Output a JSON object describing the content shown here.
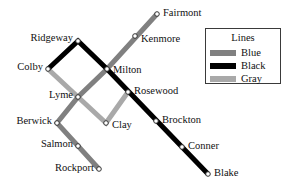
{
  "colors": {
    "blue_line": "#808080",
    "black_line": "#000000",
    "gray_line": "#a9a9a9",
    "station_fill": "#ffffff",
    "station_stroke": "#333333",
    "label_text": "#111111",
    "legend_border": "#3a3a3a",
    "background": "#ffffff"
  },
  "legend": {
    "title": "Lines",
    "entries": [
      {
        "name": "Blue",
        "color": "#808080"
      },
      {
        "name": "Black",
        "color": "#000000"
      },
      {
        "name": "Gray",
        "color": "#a9a9a9"
      }
    ]
  },
  "stations": [
    {
      "id": "fairmont",
      "label": "Fairmont",
      "x": 157,
      "y": 14,
      "label_x": 163,
      "label_y": 14,
      "anchor": "start"
    },
    {
      "id": "kenmore",
      "label": "Kenmore",
      "x": 135,
      "y": 36,
      "label_x": 141,
      "label_y": 40,
      "anchor": "start"
    },
    {
      "id": "ridgeway",
      "label": "Ridgeway",
      "x": 78,
      "y": 41,
      "label_x": 73,
      "label_y": 39,
      "anchor": "end"
    },
    {
      "id": "colby",
      "label": "Colby",
      "x": 48,
      "y": 69,
      "label_x": 43,
      "label_y": 68,
      "anchor": "end"
    },
    {
      "id": "milton",
      "label": "Milton",
      "x": 107,
      "y": 69,
      "label_x": 113,
      "label_y": 71,
      "anchor": "start"
    },
    {
      "id": "rosewood",
      "label": "Rosewood",
      "x": 128,
      "y": 92,
      "label_x": 134,
      "label_y": 92,
      "anchor": "start"
    },
    {
      "id": "lyme",
      "label": "Lyme",
      "x": 78,
      "y": 97,
      "label_x": 73,
      "label_y": 96,
      "anchor": "end"
    },
    {
      "id": "clay",
      "label": "Clay",
      "x": 106,
      "y": 123,
      "label_x": 112,
      "label_y": 126,
      "anchor": "start"
    },
    {
      "id": "brockton",
      "label": "Brockton",
      "x": 156,
      "y": 121,
      "label_x": 162,
      "label_y": 121,
      "anchor": "start"
    },
    {
      "id": "berwick",
      "label": "Berwick",
      "x": 57,
      "y": 123,
      "label_x": 52,
      "label_y": 122,
      "anchor": "end"
    },
    {
      "id": "conner",
      "label": "Conner",
      "x": 182,
      "y": 147,
      "label_x": 188,
      "label_y": 147,
      "anchor": "start"
    },
    {
      "id": "salmon",
      "label": "Salmon",
      "x": 78,
      "y": 146,
      "label_x": 73,
      "label_y": 145,
      "anchor": "end"
    },
    {
      "id": "blake",
      "label": "Blake",
      "x": 208,
      "y": 174,
      "label_x": 214,
      "label_y": 174,
      "anchor": "start"
    },
    {
      "id": "rockport",
      "label": "Rockport",
      "x": 99,
      "y": 169,
      "label_x": 94,
      "label_y": 169,
      "anchor": "end"
    }
  ],
  "lines": [
    {
      "name": "Blue",
      "color": "#808080",
      "width": 5,
      "stops": [
        "Fairmont",
        "Kenmore",
        "Milton",
        "Lyme",
        "Berwick",
        "Salmon",
        "Rockport"
      ],
      "path": "M157,14 L107,69 L78,97 L57,123 L99,169"
    },
    {
      "name": "Black",
      "color": "#000000",
      "width": 5,
      "stops": [
        "Colby",
        "Ridgeway",
        "Milton",
        "Rosewood",
        "Brockton",
        "Conner",
        "Blake"
      ],
      "path": "M48,69 L78,41 L107,69 L208,174"
    },
    {
      "name": "Gray",
      "color": "#a9a9a9",
      "width": 5,
      "stops": [
        "Colby",
        "Lyme",
        "Clay",
        "Rosewood"
      ],
      "path": "M48,69 L78,97 L106,123 L128,92"
    }
  ],
  "legend_box": {
    "x": 205,
    "y": 28,
    "width": 76,
    "height": 56
  }
}
